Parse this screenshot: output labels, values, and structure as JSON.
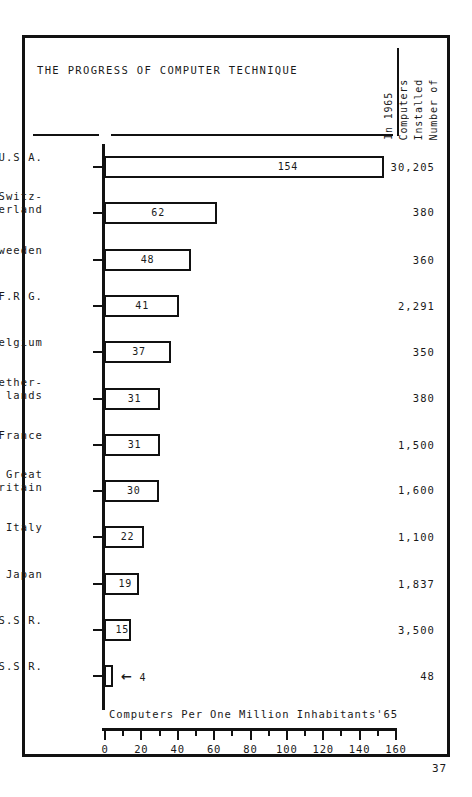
{
  "header": {
    "title": "THE PROGRESS OF COMPUTER TECHNIQUE",
    "value_column_header_lines": [
      "Number of",
      "Installed",
      "Computers",
      "In 1965"
    ]
  },
  "axis": {
    "caption": "Computers Per One Million Inhabitants'65",
    "tick_labels": [
      "0",
      "20",
      "40",
      "60",
      "80",
      "100",
      "120",
      "140",
      "160"
    ],
    "minor_tick_values": [
      10,
      30,
      50,
      70,
      90,
      110,
      130,
      150
    ]
  },
  "footer": {
    "page_number": "37"
  },
  "chart_data": {
    "type": "bar",
    "orientation": "horizontal",
    "title": "THE PROGRESS OF COMPUTER TECHNIQUE",
    "xlabel": "Computers Per One Million Inhabitants'65",
    "ylabel": "",
    "xlim": [
      0,
      160
    ],
    "xticks": [
      0,
      20,
      40,
      60,
      80,
      100,
      120,
      140,
      160
    ],
    "grid": false,
    "legend": "none",
    "value_column_label": "Number of Installed Computers In 1965",
    "categories": [
      "U.S.A.",
      "Switz-\nerland",
      "Sweeden",
      "F.R.G.",
      "Belgium",
      "Nether-\nlands",
      "France",
      "Great\nBritain",
      "Italy",
      "Japan",
      "U.S.S.R.",
      "C.S.S.R."
    ],
    "values": [
      154,
      62,
      48,
      41,
      37,
      31,
      31,
      30,
      22,
      19,
      15,
      4
    ],
    "value_labels": [
      "154",
      "62",
      "48",
      "41",
      "37",
      "31",
      "31",
      "30",
      "22",
      "19",
      "15",
      "4"
    ],
    "installed_computers_1965": [
      "30,205",
      "380",
      "360",
      "2,291",
      "350",
      "380",
      "1,500",
      "1,600",
      "1,100",
      "1,837",
      "3,500",
      "48"
    ],
    "annotations": [
      {
        "category": "C.S.S.R.",
        "glyph": "←",
        "text": "4",
        "note": "value label placed outside bar with left arrow"
      }
    ]
  },
  "colors": {
    "ink": "#111111",
    "paper": "#ffffff"
  }
}
